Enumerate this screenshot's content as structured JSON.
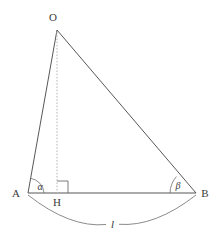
{
  "figure": {
    "background_color": "#ffffff",
    "stroke_color": "#444444",
    "dashed_color": "#b9b9b9",
    "arc_color": "#6b6b6b",
    "label_color": "#3a3a3a"
  },
  "points": {
    "O": {
      "label": "O",
      "x": 57,
      "y": 30,
      "label_x": 53,
      "label_y": 21
    },
    "A": {
      "label": "A",
      "x": 28,
      "y": 193,
      "label_x": 13,
      "label_y": 197
    },
    "B": {
      "label": "B",
      "x": 196,
      "y": 193,
      "label_x": 201,
      "label_y": 197
    },
    "H": {
      "label": "H",
      "x": 57,
      "y": 193,
      "label_x": 53,
      "label_y": 206
    }
  },
  "segments": [
    {
      "name": "OA",
      "from": "O",
      "to": "A",
      "style": "solid"
    },
    {
      "name": "OB",
      "from": "O",
      "to": "B",
      "style": "solid"
    },
    {
      "name": "AB",
      "from": "A",
      "to": "B",
      "style": "solid"
    },
    {
      "name": "OH",
      "from": "O",
      "to": "H",
      "style": "dashed"
    }
  ],
  "angles": {
    "alpha": {
      "label": "α",
      "at": "A",
      "label_x": 38,
      "label_y": 190
    },
    "beta": {
      "label": "β",
      "at": "B",
      "label_x": 177,
      "label_y": 189
    },
    "right_angle": {
      "at": "H",
      "marker": "square",
      "size": 11
    }
  },
  "length_arc": {
    "label": "l",
    "label_x": 112,
    "label_y": 224,
    "from_x": 28,
    "from_y": 195,
    "to_x": 196,
    "to_y": 195,
    "sag_y": 226
  }
}
